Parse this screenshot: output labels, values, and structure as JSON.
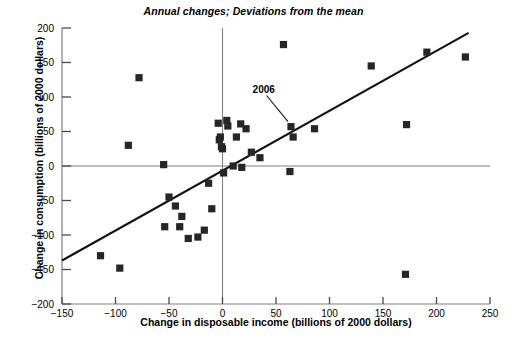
{
  "chart_data": {
    "type": "scatter",
    "title": "Annual changes; Deviations from the mean",
    "xlabel": "Change in disposable income (billions of 2000 dollars)",
    "ylabel": "Change in consumption (billions of 2000 dollars)",
    "xlim": [
      -150,
      250
    ],
    "ylim": [
      -200,
      200
    ],
    "xticks": [
      -150,
      -100,
      -50,
      0,
      50,
      100,
      150,
      200,
      250
    ],
    "yticks": [
      -200,
      -150,
      -100,
      -50,
      0,
      50,
      100,
      150,
      200
    ],
    "xtick_labels": [
      "−150",
      "−100",
      "−50",
      "0",
      "50",
      "100",
      "150",
      "200",
      "250"
    ],
    "ytick_labels": [
      "−200",
      "−150",
      "−100",
      "−50",
      "0",
      "50",
      "100",
      "150",
      "200"
    ],
    "grid": false,
    "legend": "none",
    "marker": "square",
    "marker_color": "#262626",
    "axis_color": "#808080",
    "points": [
      {
        "x": -114,
        "y": -130
      },
      {
        "x": -96,
        "y": -148
      },
      {
        "x": -88,
        "y": 30
      },
      {
        "x": -78,
        "y": 128
      },
      {
        "x": -55,
        "y": 2
      },
      {
        "x": -54,
        "y": -88
      },
      {
        "x": -50,
        "y": -45
      },
      {
        "x": -44,
        "y": -58
      },
      {
        "x": -40,
        "y": -88
      },
      {
        "x": -38,
        "y": -73
      },
      {
        "x": -32,
        "y": -105
      },
      {
        "x": -23,
        "y": -103
      },
      {
        "x": -17,
        "y": -93
      },
      {
        "x": -13,
        "y": -25
      },
      {
        "x": -10,
        "y": -62
      },
      {
        "x": -4,
        "y": 62
      },
      {
        "x": -3,
        "y": 38
      },
      {
        "x": -2,
        "y": 42
      },
      {
        "x": -1,
        "y": 28
      },
      {
        "x": 0,
        "y": 25
      },
      {
        "x": 1,
        "y": -10
      },
      {
        "x": 4,
        "y": 66
      },
      {
        "x": 5,
        "y": 58
      },
      {
        "x": 10,
        "y": 0
      },
      {
        "x": 13,
        "y": 42
      },
      {
        "x": 17,
        "y": 61
      },
      {
        "x": 18,
        "y": -2
      },
      {
        "x": 22,
        "y": 54
      },
      {
        "x": 27,
        "y": 20
      },
      {
        "x": 35,
        "y": 12
      },
      {
        "x": 57,
        "y": 176
      },
      {
        "x": 63,
        "y": -8
      },
      {
        "x": 64,
        "y": 57
      },
      {
        "x": 66,
        "y": 42
      },
      {
        "x": 86,
        "y": 54
      },
      {
        "x": 139,
        "y": 145
      },
      {
        "x": 171,
        "y": -157
      },
      {
        "x": 172,
        "y": 60
      },
      {
        "x": 191,
        "y": 165
      },
      {
        "x": 227,
        "y": 158
      }
    ],
    "annotations": [
      {
        "label": "2006",
        "point_x": 64,
        "point_y": 57,
        "text_x": 30,
        "text_y": 108
      }
    ],
    "trendline": {
      "x_start": -150,
      "y_start": -137,
      "x_end": 230,
      "y_end": 193
    }
  }
}
